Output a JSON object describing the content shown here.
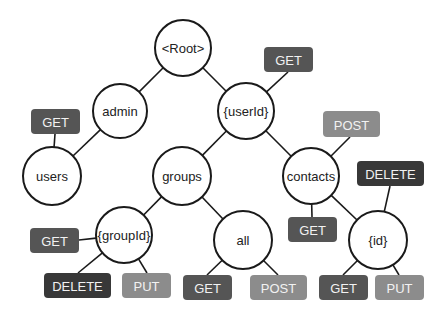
{
  "diagram": {
    "colors": {
      "GET": "#555555",
      "DELETE": "#383838",
      "PUT": "#8c8c8c",
      "POST": "#8c8c8c",
      "node_stroke": "#1a1a1a",
      "node_fill": "#ffffff"
    },
    "nodes": [
      {
        "id": "root",
        "label": "<Root>",
        "cx": 183,
        "cy": 48,
        "r": 28
      },
      {
        "id": "admin",
        "label": "admin",
        "cx": 120,
        "cy": 111,
        "r": 27
      },
      {
        "id": "userId",
        "label": "{userId}",
        "cx": 246,
        "cy": 111,
        "r": 28
      },
      {
        "id": "users",
        "label": "users",
        "cx": 52,
        "cy": 176,
        "r": 29
      },
      {
        "id": "groups",
        "label": "groups",
        "cx": 182,
        "cy": 176,
        "r": 29
      },
      {
        "id": "contacts",
        "label": "contacts",
        "cx": 311,
        "cy": 176,
        "r": 28
      },
      {
        "id": "groupId",
        "label": "{groupId}",
        "cx": 124,
        "cy": 235,
        "r": 28
      },
      {
        "id": "all",
        "label": "all",
        "cx": 243,
        "cy": 240,
        "r": 29
      },
      {
        "id": "idNode",
        "label": "{id}",
        "cx": 378,
        "cy": 240,
        "r": 29
      }
    ],
    "edges": [
      {
        "from": "root",
        "to": "admin"
      },
      {
        "from": "root",
        "to": "userId"
      },
      {
        "from": "admin",
        "to": "users"
      },
      {
        "from": "userId",
        "to": "groups"
      },
      {
        "from": "userId",
        "to": "contacts"
      },
      {
        "from": "groups",
        "to": "groupId"
      },
      {
        "from": "groups",
        "to": "all"
      },
      {
        "from": "contacts",
        "to": "idNode"
      }
    ],
    "methods": [
      {
        "label": "GET",
        "node": "userId",
        "x": 264,
        "y": 47,
        "w": 49,
        "h": 25,
        "ax": 288,
        "ay": 72
      },
      {
        "label": "GET",
        "node": "users",
        "x": 31,
        "y": 109,
        "w": 49,
        "h": 25,
        "ax": 55,
        "ay": 134
      },
      {
        "label": "POST",
        "node": "contacts",
        "x": 323,
        "y": 111,
        "w": 57,
        "h": 26,
        "ax": 350,
        "ay": 137
      },
      {
        "label": "DELETE",
        "node": "idNode",
        "x": 357,
        "y": 161,
        "w": 67,
        "h": 25,
        "ax": 390,
        "ay": 186
      },
      {
        "label": "GET",
        "node": "contacts",
        "x": 288,
        "y": 217,
        "w": 49,
        "h": 25,
        "ax": 312,
        "ay": 217
      },
      {
        "label": "GET",
        "node": "groupId",
        "x": 30,
        "y": 228,
        "w": 49,
        "h": 25,
        "ax": 79,
        "ay": 240
      },
      {
        "label": "DELETE",
        "node": "groupId",
        "x": 44,
        "y": 273,
        "w": 67,
        "h": 25,
        "ax": 78,
        "ay": 273
      },
      {
        "label": "PUT",
        "node": "groupId",
        "x": 122,
        "y": 273,
        "w": 49,
        "h": 25,
        "ax": 147,
        "ay": 273
      },
      {
        "label": "GET",
        "node": "all",
        "x": 183,
        "y": 275,
        "w": 49,
        "h": 25,
        "ax": 207,
        "ay": 275
      },
      {
        "label": "POST",
        "node": "all",
        "x": 250,
        "y": 275,
        "w": 57,
        "h": 25,
        "ax": 278,
        "ay": 275
      },
      {
        "label": "GET",
        "node": "idNode",
        "x": 319,
        "y": 275,
        "w": 49,
        "h": 25,
        "ax": 343,
        "ay": 275
      },
      {
        "label": "PUT",
        "node": "idNode",
        "x": 375,
        "y": 275,
        "w": 49,
        "h": 25,
        "ax": 399,
        "ay": 275
      }
    ]
  }
}
